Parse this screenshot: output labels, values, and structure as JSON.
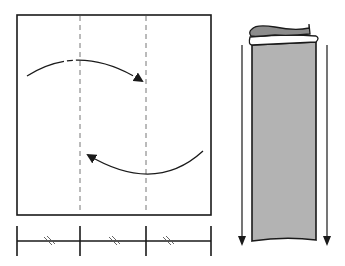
{
  "diagram": {
    "title": "Letter fold (tri-fold) illustration",
    "left_figure": {
      "description": "Square sheet divided into thirds by two dashed fold lines, with curved arrows indicating folding the left panel over and the right panel over",
      "fold_lines": 2,
      "arrows": [
        "fold-left-panel-right",
        "fold-right-panel-left"
      ],
      "scale_segments": 3,
      "scale_note": "equal thirds (marked with double hash marks)"
    },
    "right_figure": {
      "description": "Folded sheet shown as a tall grey panel with rolled top edge, with two downward arrows on each side",
      "arrows": [
        "down-left",
        "down-right"
      ],
      "fill_color": "#b3b3b3",
      "top_fold_color": "#8c8c8c"
    },
    "colors": {
      "stroke": "#1a1a1a",
      "dashed": "#777777",
      "panel_fill": "#b3b3b3",
      "panel_top": "#8c8c8c",
      "background": "#ffffff"
    }
  }
}
